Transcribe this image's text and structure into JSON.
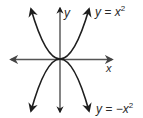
{
  "figure": {
    "curves": [
      {
        "name": "upper-parabola",
        "equation_label": {
          "prefix": "y = x",
          "exponent": "2"
        }
      },
      {
        "name": "lower-parabola",
        "equation_label": {
          "prefix": "y = −x",
          "exponent": "2"
        }
      }
    ],
    "axes": {
      "x_label": "x",
      "y_label": "y"
    },
    "colors": {
      "curve": "#1e1e1e",
      "axis": "#555555",
      "text": "#2a2a2a"
    }
  }
}
